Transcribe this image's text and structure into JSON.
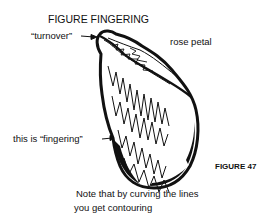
{
  "figure": {
    "title": "FIGURE FINGERING",
    "number_label": "FIGURE 47",
    "labels": {
      "turnover": "“turnover”",
      "rose_petal": "rose petal",
      "fingering": "this is “fingering”"
    },
    "caption_line1": "Note that by curving the lines",
    "caption_line2": "you get contouring",
    "colors": {
      "ink": "#111111",
      "background": "#ffffff"
    }
  }
}
